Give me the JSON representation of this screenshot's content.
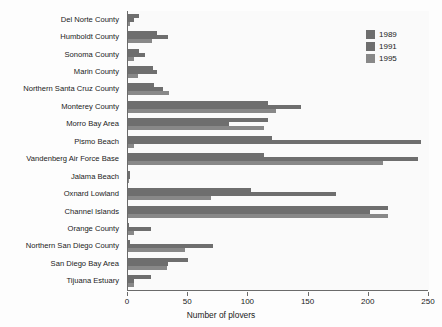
{
  "chart_data": {
    "type": "bar",
    "orientation": "horizontal",
    "title": "",
    "xlabel": "Number of plovers",
    "ylabel": "",
    "xlim": [
      0,
      250
    ],
    "xticks": [
      0,
      50,
      100,
      150,
      200,
      250
    ],
    "grid": false,
    "legend_position": "top-right",
    "categories": [
      "Del Norte County",
      "Humboldt County",
      "Sonoma County",
      "Marin County",
      "Northern Santa Cruz County",
      "Monterey County",
      "Morro Bay Area",
      "Pismo Beach",
      "Vandenberg Air Force Base",
      "Jalama Beach",
      "Oxnard Lowland",
      "Channel Islands",
      "Orange County",
      "Northern San Diego County",
      "San Diego Bay Area",
      "Tijuana Estuary"
    ],
    "series": [
      {
        "name": "1989",
        "color": "#6e6e6e",
        "values": [
          9,
          24,
          9,
          21,
          22,
          116,
          116,
          120,
          113,
          2,
          102,
          216,
          1,
          2,
          50,
          19
        ]
      },
      {
        "name": "1991",
        "color": "#6e6e6e",
        "values": [
          5,
          33,
          14,
          24,
          29,
          144,
          84,
          243,
          241,
          2,
          173,
          201,
          19,
          71,
          33,
          5
        ]
      },
      {
        "name": "1995",
        "color": "#888888",
        "values": [
          2,
          20,
          5,
          8,
          34,
          123,
          113,
          5,
          212,
          1,
          69,
          216,
          5,
          47,
          32,
          5
        ]
      }
    ]
  },
  "legend": {
    "entries": [
      {
        "label": "1989"
      },
      {
        "label": "1991"
      },
      {
        "label": "1995"
      }
    ]
  },
  "axis": {
    "x_title": "Number of plovers"
  }
}
